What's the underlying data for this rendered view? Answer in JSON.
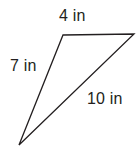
{
  "figure": {
    "type": "geometry-diagram",
    "shape_name": "triangle",
    "background_color": "#ffffff",
    "stroke_color": "#231f20",
    "stroke_width": 1.3,
    "text_color": "#231f20",
    "vertices": [
      {
        "name": "top-left",
        "x": 63,
        "y": 35
      },
      {
        "name": "top-right",
        "x": 134,
        "y": 34
      },
      {
        "name": "bottom",
        "x": 19,
        "y": 145
      }
    ],
    "edges": [
      {
        "name": "top-edge",
        "from": "top-left",
        "to": "top-right",
        "label": "4 in"
      },
      {
        "name": "left-edge",
        "from": "top-left",
        "to": "bottom",
        "label": "7 in"
      },
      {
        "name": "hypotenuse-edge",
        "from": "top-right",
        "to": "bottom",
        "label": "10 in"
      }
    ],
    "labels": {
      "top": "4 in",
      "left": "7 in",
      "hypotenuse": "10 in"
    },
    "units": "in"
  }
}
